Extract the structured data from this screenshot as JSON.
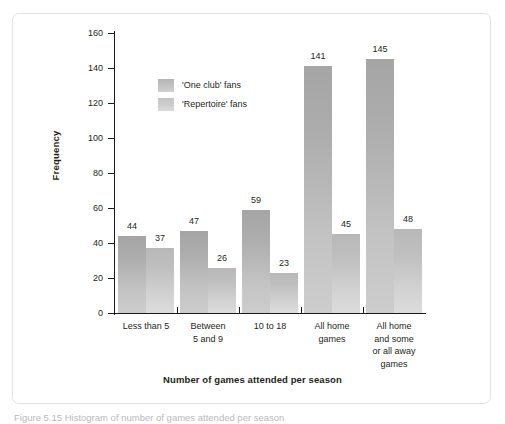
{
  "chart_data": {
    "type": "bar",
    "title": "",
    "xlabel": "Number of games attended per season",
    "ylabel": "Frequency",
    "ylim": [
      0,
      160
    ],
    "yticks": [
      0,
      20,
      40,
      60,
      80,
      100,
      120,
      140,
      160
    ],
    "grid": false,
    "legend_position": "inside-top-left",
    "categories": [
      "Less than 5",
      "Between\n5 and 9",
      "10 to 18",
      "All home\ngames",
      "All home\nand some\nor all away\ngames"
    ],
    "series": [
      {
        "name": "'One club' fans",
        "color": "#b4b4b4",
        "values": [
          44,
          47,
          59,
          141,
          145
        ]
      },
      {
        "name": "'Repertoire' fans",
        "color": "#c9c9c9",
        "values": [
          37,
          26,
          23,
          45,
          48
        ]
      }
    ]
  },
  "figure": {
    "caption": "Figure 5.15  Histogram of number of games attended per season"
  },
  "colors": {
    "axis": "#1a1a1a",
    "text": "#231f20",
    "frame_border": "#e2e2e2",
    "background": "#ffffff"
  }
}
